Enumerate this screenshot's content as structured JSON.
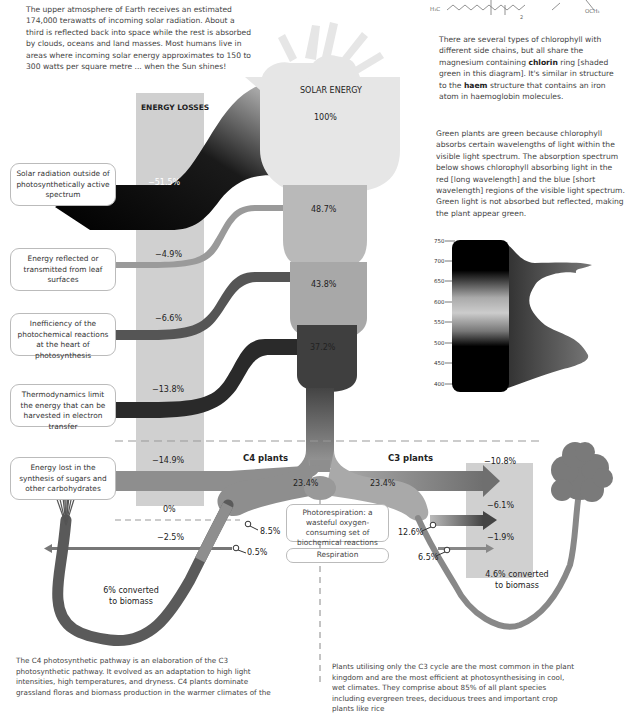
{
  "intro": {
    "text": "The upper atmosphere of Earth receives an estimated 174,000 terawatts of incoming solar radiation. About a third is reflected back into space while the rest is absorbed by clouds, oceans and land masses. Most humans live in areas where incoming solar energy approximates to 150 to 300 watts per square metre ... when the Sun shines!"
  },
  "chlorophyll_note": {
    "part1": "There are several types of chlorophyll with different side chains, but all share the magnesium containing ",
    "bold1": "chlorin",
    "part2": " ring [shaded green in this diagram]. It's similar in structure to the ",
    "bold2": "haem",
    "part3": " structure that contains an iron atom in haemoglobin molecules."
  },
  "green_note": {
    "text": "Green plants are green because chlorophyll absorbs certain wavelengths of light within the visible light spectrum. The absorption spectrum below shows chlorophyll absorbing light in the red [long wavelength] and the blue [short wavelength] regions of the visible light spectrum. Green light is not absorbed but reflected, making the plant appear green."
  },
  "formula": {
    "h3c": "H₃C",
    "och3": "OCH₃",
    "sub2": "2"
  },
  "absorption_spectrum": {
    "axis_ticks": [
      "750",
      "700",
      "650",
      "600",
      "550",
      "500",
      "450",
      "400"
    ]
  },
  "energy_losses": {
    "header": "ENERGY LOSSES",
    "items": [
      {
        "label": "Solar radiation outside of photosynthetically active spectrum",
        "value": "−51.5%"
      },
      {
        "label": "Energy reflected or transmitted from leaf surfaces",
        "value": "−4.9%"
      },
      {
        "label": "Inefficiency of the photochemical reactions at the heart of photosynthesis",
        "value": "−6.6%"
      },
      {
        "label": "Thermodynamics limit the energy that can be harvested in electron transfer",
        "value": "−13.8%"
      },
      {
        "label": "Energy lost in the synthesis of sugars and other carbohydrates",
        "value": "−14.9%"
      }
    ],
    "c4_photorespiration": "0%",
    "c4_respiration": "−2.5%"
  },
  "solar": {
    "title": "SOLAR ENERGY",
    "value": "100%"
  },
  "stages": [
    "48.7%",
    "43.8%",
    "37.2%"
  ],
  "c4": {
    "title": "C4 plants",
    "value": "23.4%",
    "after_photorespiration": "8.5%",
    "after_respiration": "0.5%",
    "biomass": "6% converted to biomass"
  },
  "c3": {
    "title": "C3 plants",
    "value": "23.4%",
    "after_photorespiration": "12.6%",
    "after_respiration": "6.5%",
    "losses": [
      "−10.8%",
      "−6.1%",
      "−1.9%"
    ],
    "biomass": "4.6% converted to biomass"
  },
  "middle": {
    "photorespiration": "Photorespiration: a wasteful oxygen-consuming set of biochemical reactions",
    "respiration": "Respiration"
  },
  "c4_note": {
    "text": "The C4 photosynthetic pathway is an elaboration of the C3 photosynthetic pathway. It evolved as an adaptation to high light intensities, high temperatures, and dryness. C4 plants dominate grassland floras and biomass production in the warmer climates of the"
  },
  "c3_note": {
    "text": "Plants utilising only the C3 cycle are the most common in the plant kingdom and are the most efficient at photosynthesising in cool, wet climates. They comprise about 85% of all plant species including evergreen trees, deciduous trees and important crop plants like rice"
  },
  "colors": {
    "loss_column": "#d0d0d0",
    "solar_shape": "#e4e4e4",
    "stage1": "#b9b9b9",
    "stage2": "#a8a8a8",
    "stage3": "#3f3f3f",
    "c4_stream": "#8e8e8e",
    "c3_stream": "#a9a9a9",
    "dark_loss": "#111111"
  }
}
